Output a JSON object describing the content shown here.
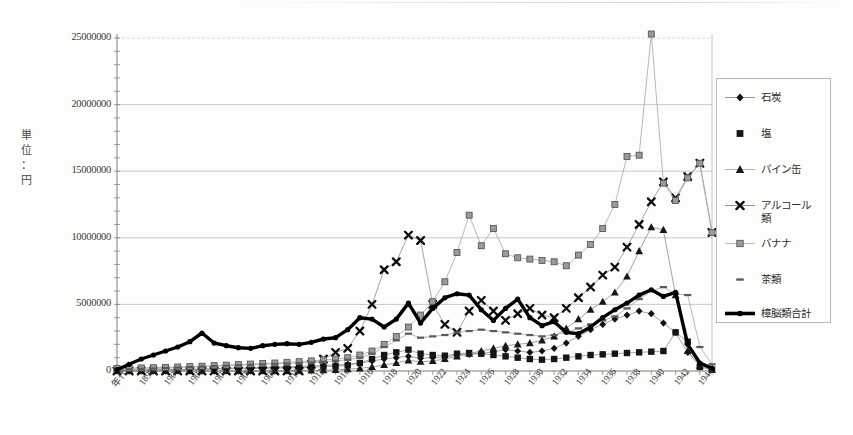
{
  "chart_data": {
    "type": "line",
    "title": "",
    "subtitle": "",
    "xlabel": "年代",
    "ylabel": "単位：円",
    "ylim": [
      0,
      25000000
    ],
    "ytick_labels": [
      "0",
      "5000000",
      "10000000",
      "15000000",
      "20000000",
      "25000000"
    ],
    "ytick_values": [
      0,
      5000000,
      10000000,
      15000000,
      20000000,
      25000000
    ],
    "grid": true,
    "legend_position": "right",
    "x": [
      1896,
      1897,
      1898,
      1899,
      1900,
      1901,
      1902,
      1903,
      1904,
      1905,
      1906,
      1907,
      1908,
      1909,
      1910,
      1911,
      1912,
      1913,
      1914,
      1915,
      1916,
      1917,
      1918,
      1919,
      1920,
      1921,
      1922,
      1923,
      1924,
      1925,
      1926,
      1927,
      1928,
      1929,
      1930,
      1931,
      1932,
      1933,
      1934,
      1935,
      1936,
      1937,
      1938,
      1939,
      1940,
      1941,
      1942,
      1943,
      1944,
      1945
    ],
    "xtick_labels": [
      "年代",
      "1898",
      "1900",
      "1902",
      "1904",
      "1906",
      "1908",
      "1910",
      "1912",
      "1914",
      "1916",
      "1918",
      "1920",
      "1922",
      "1924",
      "1926",
      "1928",
      "1930",
      "1932",
      "1934",
      "1936",
      "1938",
      "1940",
      "1942",
      "1944"
    ],
    "series": [
      {
        "name": "石炭",
        "marker": "diamond",
        "color": "#111111",
        "values": [
          20000,
          30000,
          40000,
          60000,
          90000,
          110000,
          130000,
          150000,
          170000,
          200000,
          220000,
          250000,
          280000,
          300000,
          330000,
          360000,
          390000,
          420000,
          450000,
          500000,
          600000,
          750000,
          900000,
          1000000,
          1100000,
          950000,
          1000000,
          1050000,
          1200000,
          1250000,
          1300000,
          1450000,
          1600000,
          1500000,
          1400000,
          1500000,
          1700000,
          2100000,
          2600000,
          3100000,
          3500000,
          3900000,
          4200000,
          4500000,
          4300000,
          3600000,
          2900000,
          1400000,
          400000,
          150000
        ]
      },
      {
        "name": "塩",
        "marker": "square",
        "color": "#151515",
        "values": [
          60000,
          70000,
          80000,
          90000,
          100000,
          110000,
          120000,
          130000,
          150000,
          160000,
          170000,
          180000,
          200000,
          220000,
          240000,
          260000,
          290000,
          320000,
          350000,
          420000,
          600000,
          900000,
          1200000,
          1400000,
          1600000,
          1300000,
          1200000,
          1150000,
          1300000,
          1350000,
          1300000,
          1200000,
          1100000,
          1000000,
          900000,
          850000,
          900000,
          1000000,
          1100000,
          1200000,
          1250000,
          1300000,
          1350000,
          1400000,
          1450000,
          1500000,
          2900000,
          2200000,
          300000,
          100000
        ]
      },
      {
        "name": "パイン缶",
        "marker": "triangle",
        "color": "#171717",
        "values": [
          0,
          0,
          0,
          0,
          0,
          0,
          0,
          0,
          0,
          0,
          0,
          0,
          0,
          0,
          10000,
          20000,
          40000,
          60000,
          90000,
          130000,
          200000,
          300000,
          450000,
          600000,
          800000,
          700000,
          750000,
          900000,
          1100000,
          1300000,
          1500000,
          1700000,
          1900000,
          2000000,
          2100000,
          2300000,
          2600000,
          3200000,
          3900000,
          4600000,
          5200000,
          5900000,
          7100000,
          9000000,
          10800000,
          10600000,
          5700000,
          1500000,
          400000,
          100000
        ]
      },
      {
        "name": "アルコール類",
        "marker": "x",
        "color": "#0d0d0d",
        "values": [
          0,
          0,
          0,
          0,
          0,
          0,
          0,
          0,
          0,
          0,
          0,
          0,
          0,
          0,
          0,
          0,
          500000,
          900000,
          1400000,
          1700000,
          3000000,
          5000000,
          7600000,
          8200000,
          10200000,
          9800000,
          5000000,
          3500000,
          2900000,
          4500000,
          5300000,
          4500000,
          3800000,
          4300000,
          4700000,
          4200000,
          4000000,
          4700000,
          5500000,
          6300000,
          7200000,
          7800000,
          9300000,
          11000000,
          12700000,
          14200000,
          13000000,
          14600000,
          15600000,
          10400000
        ]
      },
      {
        "name": "バナナ",
        "marker": "square-light",
        "color": "#8a8a8a",
        "values": [
          200000,
          210000,
          230000,
          250000,
          270000,
          300000,
          330000,
          360000,
          400000,
          440000,
          480000,
          520000,
          560000,
          600000,
          650000,
          700000,
          760000,
          830000,
          900000,
          1000000,
          1200000,
          1500000,
          2000000,
          2600000,
          3300000,
          4200000,
          5200000,
          6700000,
          8900000,
          11700000,
          9400000,
          10700000,
          8800000,
          8500000,
          8400000,
          8300000,
          8200000,
          7900000,
          8700000,
          9500000,
          10700000,
          12500000,
          16100000,
          16200000,
          25300000,
          14100000,
          12800000,
          14500000,
          15600000,
          10400000
        ]
      },
      {
        "name": "茶類",
        "marker": "dash",
        "color": "#5a5a5a",
        "values": [
          100000,
          130000,
          160000,
          180000,
          220000,
          260000,
          300000,
          330000,
          360000,
          400000,
          430000,
          460000,
          500000,
          530000,
          560000,
          600000,
          640000,
          700000,
          760000,
          850000,
          1000000,
          1300000,
          1800000,
          2300000,
          2800000,
          2500000,
          2600000,
          2700000,
          2900000,
          3000000,
          3100000,
          3000000,
          2900000,
          2800000,
          2700000,
          2600000,
          2700000,
          2900000,
          3200000,
          3500000,
          3800000,
          4100000,
          4700000,
          5400000,
          6000000,
          6300000,
          5800000,
          5700000,
          1800000,
          500000
        ]
      },
      {
        "name": "樟脳類合計",
        "marker": "circle-thick",
        "color": "#000000",
        "values": [
          100000,
          500000,
          900000,
          1200000,
          1500000,
          1800000,
          2200000,
          2850000,
          2100000,
          1900000,
          1750000,
          1700000,
          1900000,
          2000000,
          2050000,
          2000000,
          2150000,
          2400000,
          2500000,
          3100000,
          4000000,
          3900000,
          3300000,
          3900000,
          5100000,
          3600000,
          4700000,
          5500000,
          5800000,
          5700000,
          4600000,
          3800000,
          4700000,
          5400000,
          4000000,
          3400000,
          3700000,
          2900000,
          2800000,
          3300000,
          4000000,
          4600000,
          5100000,
          5700000,
          6100000,
          5600000,
          5900000,
          2000000,
          600000,
          200000
        ]
      }
    ]
  },
  "legend": {
    "items": [
      {
        "label": "石炭",
        "label2": ""
      },
      {
        "label": "塩",
        "label2": ""
      },
      {
        "label": "パイン缶",
        "label2": ""
      },
      {
        "label": "アルコール",
        "label2": "類"
      },
      {
        "label": "バナナ",
        "label2": ""
      },
      {
        "label": "茶類",
        "label2": ""
      },
      {
        "label": "樟脳類合計",
        "label2": ""
      }
    ]
  },
  "axis": {
    "y_title_chars": [
      "単",
      "位",
      "：",
      "円"
    ]
  }
}
